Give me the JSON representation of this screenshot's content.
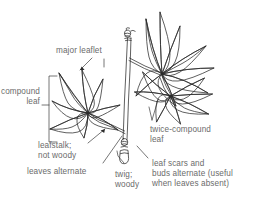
{
  "figure": {
    "type": "botanical-line-drawing",
    "background_color": "#ffffff",
    "ink_color": "#2b2b2b",
    "label_color": "#6b6b6b"
  },
  "labels": {
    "major_leaflet": "major leaflet",
    "compound_leaf_line1": "compound",
    "compound_leaf_line2": "leaf",
    "leafstalk_line1": "leafstalk;",
    "leafstalk_line2": "not woody",
    "leaves_alternate": "leaves alternate",
    "twig_line1": "twig;",
    "twig_line2": "woody",
    "twice_compound_line1": "twice-compound",
    "twice_compound_line2": "leaf",
    "leaf_scars_line1": "leaf scars and",
    "leaf_scars_line2": "buds alternate (useful",
    "leaf_scars_line3": "when leaves absent)"
  },
  "parts": {
    "twig": "twig",
    "compound_leaf": "compound-leaf",
    "twice_compound_leaf": "twice-compound-leaf",
    "upper_bud": "upper-bud-node",
    "lower_bud": "lower-bud-node",
    "bracket": "compound-leaf-bracket"
  }
}
